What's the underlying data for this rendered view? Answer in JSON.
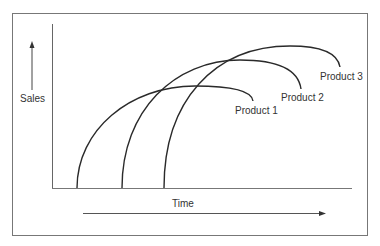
{
  "diagram": {
    "y_axis_label": "Sales",
    "x_axis_label": "Time",
    "curves": [
      {
        "label": "Product 1"
      },
      {
        "label": "Product 2"
      },
      {
        "label": "Product 3"
      }
    ]
  },
  "colors": {
    "line": "#2a2a2a",
    "frame": "#777777",
    "text": "#333333"
  }
}
